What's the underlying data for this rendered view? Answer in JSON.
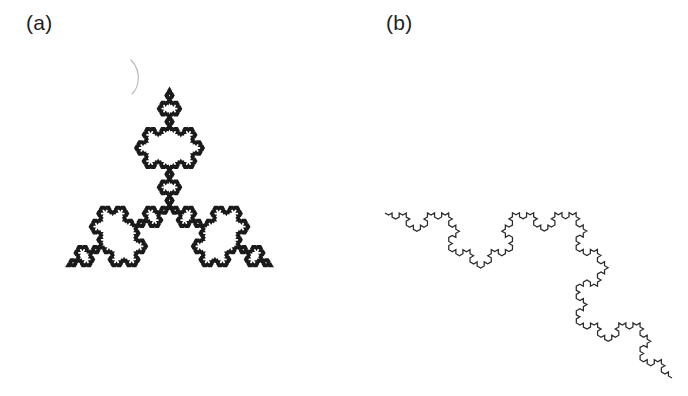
{
  "figure": {
    "background_color": "#ffffff",
    "width": 688,
    "height": 396,
    "ink_color": "#231f20"
  },
  "panels": [
    {
      "id": "a",
      "label": "(a)",
      "name": "Koch snowflake",
      "shape_type": "koch-snowflake",
      "iterations": 5,
      "closed": true,
      "stroke_color": "#1a1a1a",
      "stroke_width": 2.6,
      "bounds": {
        "x": 32,
        "y": 38,
        "width": 275,
        "height": 307
      },
      "geometry": {
        "triangle_center_x": 169.5,
        "triangle_center_y": 207,
        "circumradius": 118,
        "base_rotation_deg": -90
      },
      "artifact": {
        "name": "pencil-arc-smudge",
        "path": "M 131 60 q 9 9 7 22 q -1 7 -6 12",
        "color": "#9a9a9a"
      }
    },
    {
      "id": "b",
      "label": "(b)",
      "name": "Koch curve",
      "shape_type": "koch-curve",
      "iterations": 4,
      "closed": false,
      "stroke_color": "#2b2b2b",
      "stroke_width": 1.25,
      "bounds": {
        "x": 385,
        "y": 148,
        "width": 288,
        "height": 232
      },
      "geometry": {
        "start_x": 385,
        "start_y": 213,
        "end_x": 672,
        "end_y": 378,
        "bulge_side": "left"
      }
    }
  ],
  "chart_data": {
    "type": "diagram",
    "title": "",
    "subtitle": "",
    "items": [
      {
        "label": "(a)",
        "description": "Koch snowflake, closed fractal curve, 5 iterations",
        "segments": 3072,
        "fractal_dimension": 1.2619
      },
      {
        "label": "(b)",
        "description": "Koch curve, open fractal curve, 4 iterations",
        "segments": 256,
        "fractal_dimension": 1.2619
      }
    ]
  }
}
